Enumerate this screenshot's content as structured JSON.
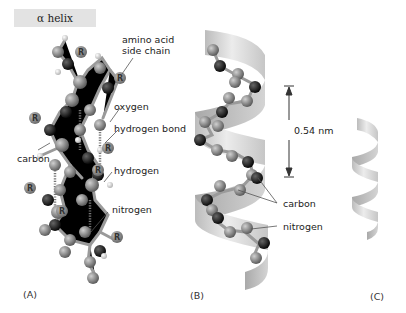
{
  "title": "α helix",
  "panels": [
    {
      "id": "A",
      "label": "(A)"
    },
    {
      "id": "B",
      "label": "(B)"
    },
    {
      "id": "C",
      "label": "(C)"
    }
  ],
  "panel_a_labels": {
    "amino_acid_side_chain_1": "amino acid",
    "amino_acid_side_chain_2": "side chain",
    "oxygen": "oxygen",
    "hydrogen_bond": "hydrogen bond",
    "carbon": "carbon",
    "hydrogen": "hydrogen",
    "nitrogen": "nitrogen",
    "side_chain_marker": "R"
  },
  "panel_b_labels": {
    "pitch": "0.54 nm",
    "carbon": "carbon",
    "nitrogen": "nitrogen"
  },
  "colors": {
    "title_bg": "#e3e3e3",
    "carbon_atom": "#8a8a8a",
    "nitrogen_atom": "#1a1a1a",
    "hydrogen_atom": "#f2f2f2",
    "ribbon": "#d9d9d9",
    "leader_line": "#555555"
  }
}
